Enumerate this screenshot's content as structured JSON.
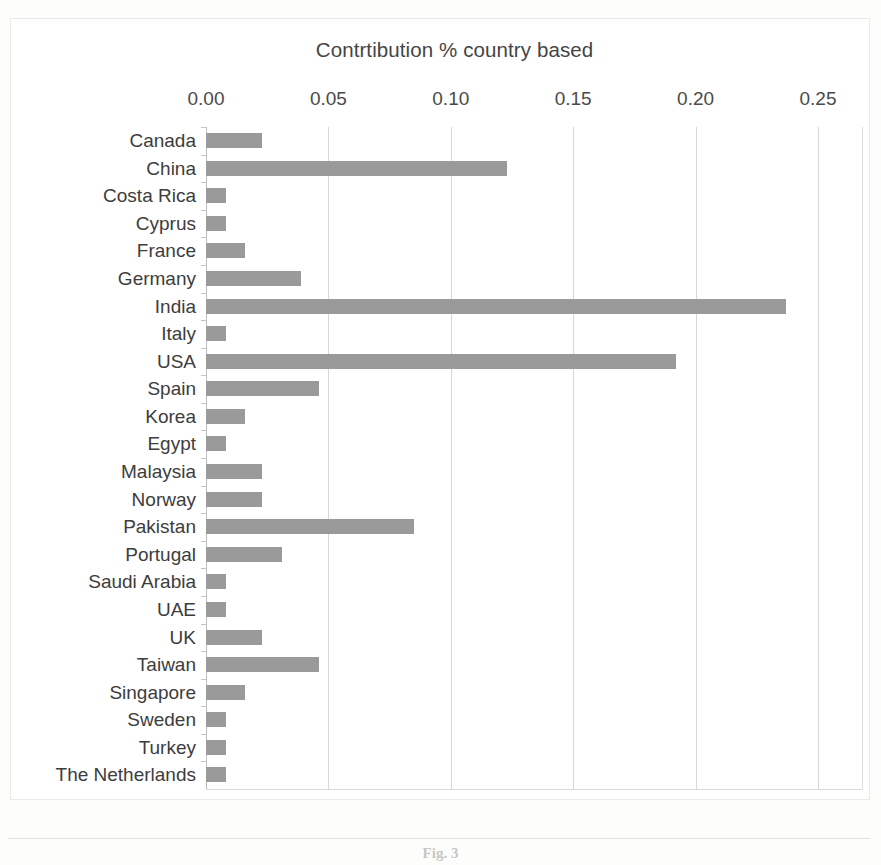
{
  "chart_data": {
    "type": "bar",
    "orientation": "horizontal",
    "title": "Contrtibution % country based",
    "xlabel": "",
    "ylabel": "",
    "xlim": [
      0.0,
      0.25
    ],
    "xticks": [
      "0.00",
      "0.05",
      "0.10",
      "0.15",
      "0.20",
      "0.25"
    ],
    "xtick_values": [
      0.0,
      0.05,
      0.1,
      0.15,
      0.2,
      0.25
    ],
    "grid": "vertical",
    "legend": "none",
    "bar_color": "#9a9a9a",
    "categories": [
      "Canada",
      "China",
      "Costa Rica",
      "Cyprus",
      "France",
      "Germany",
      "India",
      "Italy",
      "USA",
      "Spain",
      "Korea",
      "Egypt",
      "Malaysia",
      "Norway",
      "Pakistan",
      "Portugal",
      "Saudi Arabia",
      "UAE",
      "UK",
      "Taiwan",
      "Singapore",
      "Sweden",
      "Turkey",
      "The Netherlands"
    ],
    "values": [
      0.023,
      0.123,
      0.008,
      0.008,
      0.016,
      0.039,
      0.237,
      0.008,
      0.192,
      0.046,
      0.016,
      0.008,
      0.023,
      0.023,
      0.085,
      0.031,
      0.008,
      0.008,
      0.023,
      0.046,
      0.016,
      0.008,
      0.008,
      0.008
    ]
  },
  "caption": {
    "text": "Fig. 3   "
  }
}
